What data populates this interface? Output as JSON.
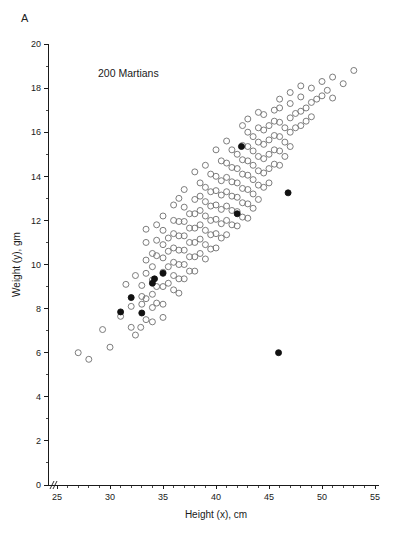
{
  "figure": {
    "panel_label": "A",
    "annotation": "200 Martians",
    "background_color": "#ffffff"
  },
  "chart_data": {
    "type": "scatter",
    "title": "",
    "subtitle": "",
    "annotations": [
      "A",
      "200 Martians"
    ],
    "xlabel": "Height (x), cm",
    "ylabel": "Weight (y), gm",
    "xlim": [
      24,
      56
    ],
    "ylim": [
      0,
      20
    ],
    "xticks": [
      25,
      30,
      35,
      40,
      45,
      50,
      55
    ],
    "xtick_labels": [
      "25",
      "30",
      "35",
      "40",
      "45",
      "50",
      "55"
    ],
    "x_minor_tick_step": 1,
    "yticks": [
      0,
      2,
      4,
      6,
      8,
      10,
      12,
      14,
      16,
      18,
      20
    ],
    "ytick_labels": [
      "0",
      "2",
      "4",
      "6",
      "8",
      "10",
      "12",
      "14",
      "16",
      "18",
      "20"
    ],
    "y_minor_tick_step": 1,
    "grid": false,
    "legend": null,
    "axis_break_x": true,
    "marker_open_color": "#6e6e6e",
    "marker_filled_color": "#111111",
    "marker_radius_px": 3,
    "n_points_label": "200 Martians",
    "series": [
      {
        "name": "Martians (sample)",
        "marker": "open-circle",
        "color": "#6e6e6e",
        "points": [
          [
            27.0,
            6.0
          ],
          [
            28.0,
            5.7
          ],
          [
            29.3,
            7.05
          ],
          [
            30.0,
            6.25
          ],
          [
            31.0,
            7.65
          ],
          [
            31.5,
            9.1
          ],
          [
            32.0,
            8.1
          ],
          [
            32.0,
            7.15
          ],
          [
            32.4,
            6.8
          ],
          [
            32.4,
            9.5
          ],
          [
            32.9,
            7.15
          ],
          [
            33.0,
            8.55
          ],
          [
            33.0,
            8.2
          ],
          [
            33.0,
            9.05
          ],
          [
            33.4,
            10.2
          ],
          [
            33.4,
            11.0
          ],
          [
            33.4,
            9.6
          ],
          [
            33.4,
            8.45
          ],
          [
            33.4,
            7.5
          ],
          [
            34.0,
            10.5
          ],
          [
            34.0,
            9.9
          ],
          [
            34.0,
            9.3
          ],
          [
            34.0,
            8.65
          ],
          [
            34.0,
            8.05
          ],
          [
            34.0,
            7.4
          ],
          [
            34.4,
            11.1
          ],
          [
            34.4,
            10.4
          ],
          [
            34.4,
            9.0
          ],
          [
            34.4,
            8.25
          ],
          [
            35.0,
            11.55
          ],
          [
            35.0,
            10.9
          ],
          [
            35.0,
            10.3
          ],
          [
            35.0,
            9.65
          ],
          [
            35.0,
            9.0
          ],
          [
            35.0,
            8.2
          ],
          [
            35.0,
            7.6
          ],
          [
            35.5,
            11.2
          ],
          [
            35.5,
            10.6
          ],
          [
            35.5,
            9.9
          ],
          [
            35.5,
            9.15
          ],
          [
            36.0,
            12.0
          ],
          [
            36.0,
            11.4
          ],
          [
            36.0,
            10.75
          ],
          [
            36.0,
            10.1
          ],
          [
            36.0,
            9.5
          ],
          [
            36.0,
            8.85
          ],
          [
            36.5,
            11.95
          ],
          [
            36.5,
            11.3
          ],
          [
            36.5,
            10.65
          ],
          [
            36.5,
            10.0
          ],
          [
            36.5,
            9.35
          ],
          [
            36.5,
            8.7
          ],
          [
            37.0,
            12.6
          ],
          [
            37.0,
            11.95
          ],
          [
            37.0,
            11.3
          ],
          [
            37.0,
            10.65
          ],
          [
            37.0,
            10.0
          ],
          [
            37.0,
            9.35
          ],
          [
            37.5,
            12.3
          ],
          [
            37.5,
            11.65
          ],
          [
            37.5,
            11.0
          ],
          [
            37.5,
            10.35
          ],
          [
            37.5,
            9.7
          ],
          [
            38.0,
            12.95
          ],
          [
            38.0,
            12.3
          ],
          [
            38.0,
            11.65
          ],
          [
            38.0,
            11.0
          ],
          [
            38.0,
            10.35
          ],
          [
            38.0,
            9.7
          ],
          [
            38.5,
            13.1
          ],
          [
            38.5,
            12.45
          ],
          [
            38.5,
            11.8
          ],
          [
            38.5,
            11.15
          ],
          [
            38.5,
            10.5
          ],
          [
            39.0,
            13.5
          ],
          [
            39.0,
            12.85
          ],
          [
            39.0,
            12.2
          ],
          [
            39.0,
            11.55
          ],
          [
            39.0,
            10.9
          ],
          [
            39.0,
            10.25
          ],
          [
            39.5,
            13.3
          ],
          [
            39.5,
            12.65
          ],
          [
            39.5,
            12.0
          ],
          [
            39.5,
            11.35
          ],
          [
            39.5,
            10.7
          ],
          [
            40.0,
            14.0
          ],
          [
            40.0,
            13.35
          ],
          [
            40.0,
            12.7
          ],
          [
            40.0,
            12.05
          ],
          [
            40.0,
            11.4
          ],
          [
            40.0,
            10.75
          ],
          [
            40.5,
            13.8
          ],
          [
            40.5,
            13.15
          ],
          [
            40.5,
            12.5
          ],
          [
            40.5,
            11.85
          ],
          [
            40.5,
            11.2
          ],
          [
            41.0,
            14.6
          ],
          [
            41.0,
            13.95
          ],
          [
            41.0,
            13.3
          ],
          [
            41.0,
            12.65
          ],
          [
            41.0,
            12.0
          ],
          [
            41.0,
            11.35
          ],
          [
            41.5,
            14.4
          ],
          [
            41.5,
            13.75
          ],
          [
            41.5,
            13.1
          ],
          [
            41.5,
            12.45
          ],
          [
            41.5,
            11.8
          ],
          [
            42.0,
            15.0
          ],
          [
            42.0,
            14.35
          ],
          [
            42.0,
            13.7
          ],
          [
            42.0,
            13.05
          ],
          [
            42.0,
            12.4
          ],
          [
            42.0,
            11.75
          ],
          [
            42.5,
            15.4
          ],
          [
            42.5,
            14.75
          ],
          [
            42.5,
            14.1
          ],
          [
            42.5,
            13.45
          ],
          [
            42.5,
            12.8
          ],
          [
            42.5,
            12.15
          ],
          [
            43.0,
            16.0
          ],
          [
            43.0,
            15.35
          ],
          [
            43.0,
            14.7
          ],
          [
            43.0,
            14.05
          ],
          [
            43.0,
            13.4
          ],
          [
            43.0,
            12.75
          ],
          [
            43.0,
            12.1
          ],
          [
            43.5,
            15.8
          ],
          [
            43.5,
            15.15
          ],
          [
            43.5,
            14.5
          ],
          [
            43.5,
            13.85
          ],
          [
            43.5,
            13.2
          ],
          [
            43.5,
            12.55
          ],
          [
            44.0,
            16.2
          ],
          [
            44.0,
            15.55
          ],
          [
            44.0,
            14.9
          ],
          [
            44.0,
            14.25
          ],
          [
            44.0,
            13.6
          ],
          [
            44.0,
            12.95
          ],
          [
            44.5,
            16.1
          ],
          [
            44.5,
            15.45
          ],
          [
            44.5,
            14.8
          ],
          [
            44.5,
            14.15
          ],
          [
            44.5,
            13.5
          ],
          [
            45.0,
            16.3
          ],
          [
            45.0,
            15.65
          ],
          [
            45.0,
            15.0
          ],
          [
            45.0,
            14.35
          ],
          [
            45.0,
            13.7
          ],
          [
            45.5,
            16.5
          ],
          [
            45.5,
            15.85
          ],
          [
            45.5,
            15.2
          ],
          [
            45.5,
            14.55
          ],
          [
            46.0,
            17.1
          ],
          [
            46.0,
            16.45
          ],
          [
            46.0,
            15.8
          ],
          [
            46.0,
            15.15
          ],
          [
            46.0,
            14.5
          ],
          [
            46.5,
            16.2
          ],
          [
            46.5,
            15.55
          ],
          [
            46.5,
            14.9
          ],
          [
            47.0,
            17.3
          ],
          [
            47.0,
            16.65
          ],
          [
            47.0,
            16.0
          ],
          [
            47.0,
            15.35
          ],
          [
            47.5,
            16.85
          ],
          [
            47.5,
            16.2
          ],
          [
            48.0,
            17.6
          ],
          [
            48.0,
            16.95
          ],
          [
            48.0,
            16.3
          ],
          [
            48.5,
            17.1
          ],
          [
            48.5,
            16.5
          ],
          [
            49.0,
            18.0
          ],
          [
            49.0,
            17.35
          ],
          [
            49.0,
            16.7
          ],
          [
            49.5,
            17.5
          ],
          [
            50.0,
            18.3
          ],
          [
            50.0,
            17.65
          ],
          [
            50.5,
            17.9
          ],
          [
            51.0,
            18.5
          ],
          [
            51.0,
            17.55
          ],
          [
            52.0,
            18.2
          ],
          [
            53.0,
            18.8
          ],
          [
            40.0,
            15.2
          ],
          [
            38.0,
            14.2
          ],
          [
            36.5,
            13.0
          ],
          [
            35.0,
            12.2
          ],
          [
            41.0,
            15.6
          ],
          [
            42.5,
            16.3
          ],
          [
            44.0,
            16.9
          ],
          [
            39.0,
            14.5
          ],
          [
            37.0,
            13.4
          ],
          [
            34.4,
            11.8
          ],
          [
            33.4,
            11.6
          ],
          [
            43.0,
            16.6
          ],
          [
            45.5,
            17.0
          ],
          [
            47.0,
            17.8
          ],
          [
            48.0,
            18.1
          ],
          [
            46.0,
            17.5
          ],
          [
            44.5,
            16.8
          ],
          [
            41.5,
            15.2
          ],
          [
            40.5,
            14.7
          ],
          [
            39.5,
            14.1
          ],
          [
            38.5,
            13.7
          ],
          [
            36.0,
            12.7
          ]
        ]
      },
      {
        "name": "Martians (highlighted)",
        "marker": "filled-circle",
        "color": "#111111",
        "points": [
          [
            31.0,
            7.85
          ],
          [
            32.0,
            8.5
          ],
          [
            33.0,
            7.8
          ],
          [
            34.0,
            9.15
          ],
          [
            34.2,
            9.35
          ],
          [
            35.0,
            9.6
          ],
          [
            42.0,
            12.3
          ],
          [
            42.4,
            15.35
          ],
          [
            46.8,
            13.25
          ],
          [
            45.9,
            6.0
          ]
        ]
      }
    ]
  }
}
